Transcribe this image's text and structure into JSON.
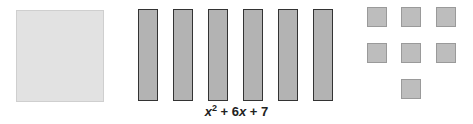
{
  "diagram": {
    "expression": {
      "x": "x",
      "exp": "2",
      "mid": " + 6",
      "x2": "x",
      "tail": " + 7"
    },
    "tiles": {
      "x_squared": {
        "count": 1,
        "color": "#e2e2e2"
      },
      "x_bars": {
        "count": 6,
        "color": "#b3b3b3"
      },
      "units": {
        "count": 7,
        "color": "#bdbdbd"
      }
    }
  }
}
